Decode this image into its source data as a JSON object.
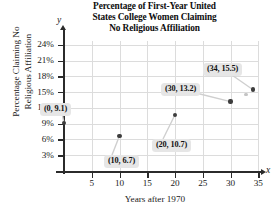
{
  "chart_data": {
    "type": "scatter",
    "title": "Percentage of First-Year United States College Women Claiming No Religious Affiliation",
    "title_lines": [
      "Percentage of First-Year United",
      "States College Women Claiming",
      "No Religious Affiliation"
    ],
    "xlabel": "Years after 1970",
    "ylabel": "Percentage Claiming No Religious Affiliation",
    "ylabel_lines": [
      "Percentage Claiming No",
      "Religious Affiliation"
    ],
    "x_axis_letter": "x",
    "y_axis_letter": "y",
    "xlim": [
      0,
      37
    ],
    "ylim": [
      0,
      26
    ],
    "grid": true,
    "legend": "none",
    "x_ticks": [
      5,
      10,
      15,
      20,
      25,
      30,
      35
    ],
    "x_tick_labels": [
      "5",
      "10",
      "15",
      "20",
      "25",
      "30",
      "35"
    ],
    "y_ticks": [
      3,
      6,
      9,
      12,
      15,
      18,
      21,
      24
    ],
    "y_tick_labels": [
      "3%",
      "6%",
      "9%",
      "12%",
      "15%",
      "18%",
      "21%",
      "24%"
    ],
    "x": [
      0,
      10,
      20,
      30,
      34
    ],
    "values": [
      9.1,
      6.7,
      10.7,
      13.2,
      15.5
    ],
    "points": [
      {
        "x": 0,
        "y": 9.1,
        "label": "(0, 9.1)"
      },
      {
        "x": 10,
        "y": 6.7,
        "label": "(10, 6.7)"
      },
      {
        "x": 20,
        "y": 10.7,
        "label": "(20, 10.7)"
      },
      {
        "x": 30,
        "y": 13.2,
        "label": "(30, 13.2)"
      },
      {
        "x": 34,
        "y": 15.5,
        "label": "(34, 15.5)"
      }
    ],
    "annotations": [
      "(0, 9.1)",
      "(10, 6.7)",
      "(20, 10.7)",
      "(30, 13.2)",
      "(34, 15.5)"
    ],
    "colors": {
      "point": "#3d3d3d",
      "grid": "#dcdcdc",
      "axis": "#2b2b2b",
      "callout_background": "#e6e6e6",
      "text": "#1a1a1a",
      "background": "#ffffff"
    }
  }
}
